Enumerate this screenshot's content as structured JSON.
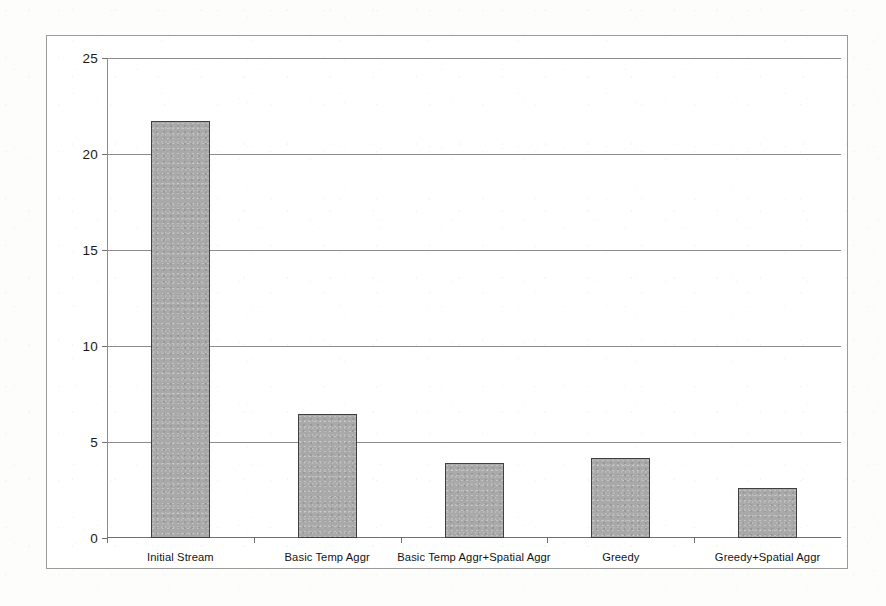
{
  "chart_data": {
    "type": "bar",
    "title": "",
    "xlabel": "",
    "ylabel": "Stream Size (MB)",
    "categories": [
      "Initial Stream",
      "Basic Temp Aggr",
      "Basic Temp Aggr+Spatial Aggr",
      "Greedy",
      "Greedy+Spatial Aggr"
    ],
    "values": [
      21.7,
      6.45,
      3.9,
      4.15,
      2.6
    ],
    "ylim": [
      0,
      25
    ],
    "yticks": [
      0,
      5,
      10,
      15,
      20,
      25
    ],
    "ytick_labels": [
      "0",
      "5",
      "10",
      "15",
      "20",
      "25"
    ],
    "grid": true,
    "legend": false,
    "legend_position": "none",
    "series": [
      {
        "name": "Stream Size (MB)",
        "values": [
          21.7,
          6.45,
          3.9,
          4.15,
          2.6
        ]
      }
    ],
    "colors": {
      "bar_fill": "#a9a9a9",
      "bar_edge": "#404040",
      "gridline": "#8d8d8d",
      "axis": "#6f6f6f",
      "text": "#131313",
      "plot_background": "#ffffff",
      "page_background": "#fdfdfc",
      "frame_border": "#9a9a9a"
    }
  }
}
